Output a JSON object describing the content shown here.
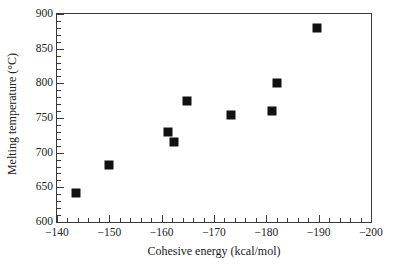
{
  "chart_data": {
    "type": "scatter",
    "title": "",
    "xlabel": "Cohesive energy (kcal/mol)",
    "ylabel": "Melting temperature (°C)",
    "xlim": [
      -140,
      -200
    ],
    "ylim": [
      600,
      900
    ],
    "x_tick_labels": [
      "−140",
      "−150",
      "−160",
      "−170",
      "−180",
      "−190",
      "−200"
    ],
    "x_tick_values": [
      -140,
      -150,
      -160,
      -170,
      -180,
      -190,
      -200
    ],
    "x_minor_step": 2,
    "y_tick_labels": [
      "600",
      "650",
      "700",
      "750",
      "800",
      "850",
      "900"
    ],
    "y_tick_values": [
      600,
      650,
      700,
      750,
      800,
      850,
      900
    ],
    "y_minor_step": 10,
    "grid": false,
    "legend": null,
    "marker": {
      "shape": "square",
      "color": "#111111",
      "size_px": 9
    },
    "x": [
      -143.6,
      -149.9,
      -161.2,
      -162.3,
      -164.9,
      -173.2,
      -181.0,
      -182.1,
      -189.7
    ],
    "y": [
      642,
      682,
      730,
      715,
      775,
      754,
      760,
      800,
      880
    ],
    "points": [
      {
        "x": -143.6,
        "y": 642
      },
      {
        "x": -149.9,
        "y": 682
      },
      {
        "x": -161.2,
        "y": 730
      },
      {
        "x": -162.3,
        "y": 715
      },
      {
        "x": -164.9,
        "y": 775
      },
      {
        "x": -173.2,
        "y": 754
      },
      {
        "x": -181.0,
        "y": 760
      },
      {
        "x": -182.1,
        "y": 800
      },
      {
        "x": -189.7,
        "y": 880
      }
    ]
  }
}
